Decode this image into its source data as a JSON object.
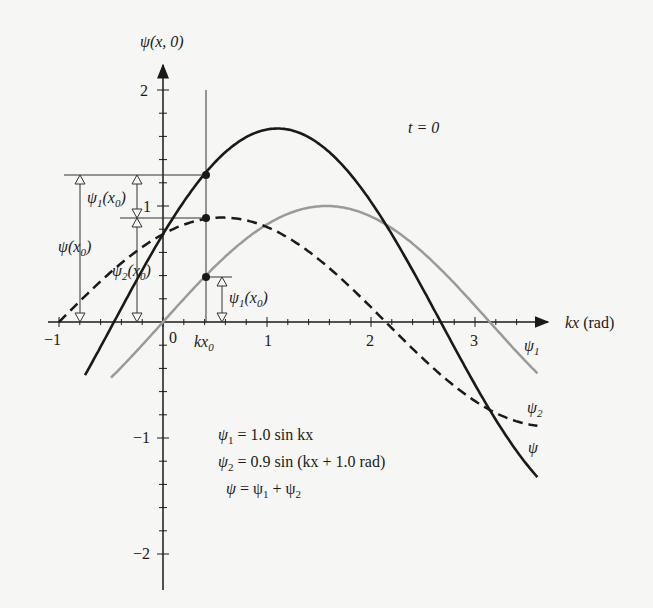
{
  "chart_data": {
    "type": "line",
    "title": "t = 0",
    "ylabel": "ψ(x, 0)",
    "xlabel": "kx (rad)",
    "xlim": [
      -1,
      3.75
    ],
    "ylim": [
      -2.1,
      2.3
    ],
    "xticks": [
      -1,
      0,
      1,
      2,
      3
    ],
    "yticks": [
      -2,
      -1,
      1,
      2
    ],
    "grid": false,
    "series": [
      {
        "name": "ψ1",
        "formula": "1.0 sin kx",
        "amplitude": 1.0,
        "phase": 0.0,
        "style": "gray solid",
        "x_range": [
          -0.5,
          3.6
        ]
      },
      {
        "name": "ψ2",
        "formula": "0.9 sin (kx + 1.0 rad)",
        "amplitude": 0.9,
        "phase": 1.0,
        "style": "black dashed",
        "x_range": [
          -1.0,
          3.6
        ]
      },
      {
        "name": "ψ",
        "formula": "ψ1 + ψ2",
        "style": "black thick solid",
        "x_range": [
          -0.75,
          3.6
        ]
      }
    ],
    "marker_x": 0.4,
    "marker_label": "kx0",
    "annotations": {
      "psi_x0": "ψ(x0)",
      "psi1_x0_left": "ψ1(x0)",
      "psi2_x0": "ψ2(x0)",
      "psi1_x0_right": "ψ1(x0)"
    },
    "legend": {
      "line1": "ψ1 = 1.0 sin kx",
      "line2": "ψ2 = 0.9 sin (kx + 1.0 rad)",
      "line3": "ψ = ψ1 + ψ2"
    },
    "curve_labels": {
      "psi1": "ψ1",
      "psi2": "ψ2",
      "psi": "ψ"
    }
  },
  "labels": {
    "y_axis": "ψ(x, 0)",
    "x_axis_kx": "kx",
    "x_axis_unit": "(rad)",
    "time": "t = 0",
    "tick_x_neg1": "−1",
    "tick_x_0": "0",
    "tick_x_1": "1",
    "tick_x_2": "2",
    "tick_x_3": "3",
    "tick_y_2": "2",
    "tick_y_1": "1",
    "tick_y_neg1": "−1",
    "tick_y_neg2": "−2",
    "kx0": "kx",
    "kx0_sub": "0",
    "psi": "ψ",
    "psi1_sub": "1",
    "psi2_sub": "2",
    "x0_open": "(x",
    "x0_sub": "0",
    "x0_close": ")",
    "eq1_rest": " = 1.0 sin kx",
    "eq2_rest": " = 0.9 sin (kx + 1.0 rad)",
    "eq3_mid": " = ψ",
    "eq3_plus": " + ψ"
  }
}
